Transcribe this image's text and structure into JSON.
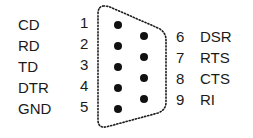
{
  "diagram": {
    "left_pins": [
      {
        "num": "1",
        "label": "CD"
      },
      {
        "num": "2",
        "label": "RD"
      },
      {
        "num": "3",
        "label": "TD"
      },
      {
        "num": "4",
        "label": "DTR"
      },
      {
        "num": "5",
        "label": "GND"
      }
    ],
    "right_pins": [
      {
        "num": "6",
        "label": "DSR"
      },
      {
        "num": "7",
        "label": "RTS"
      },
      {
        "num": "8",
        "label": "CTS"
      },
      {
        "num": "9",
        "label": "RI"
      }
    ],
    "colors": {
      "ink": "#1a1a1a",
      "background": "#ffffff"
    }
  }
}
